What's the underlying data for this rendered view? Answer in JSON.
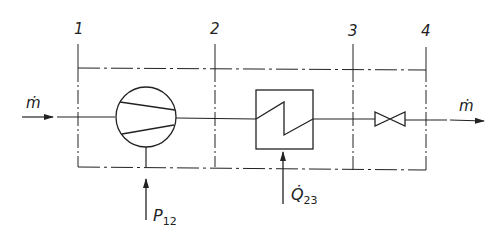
{
  "diagram": {
    "title": "",
    "state_points": [
      {
        "id": "1",
        "label": "1"
      },
      {
        "id": "2",
        "label": "2"
      },
      {
        "id": "3",
        "label": "3"
      },
      {
        "id": "4",
        "label": "4"
      }
    ],
    "flow_in": {
      "label": "ṁ"
    },
    "flow_out": {
      "label": "ṁ"
    },
    "components": [
      {
        "id": "compressor",
        "type": "compressor",
        "between": [
          "1",
          "2"
        ]
      },
      {
        "id": "heat-exchanger",
        "type": "heat-exchanger",
        "between": [
          "2",
          "3"
        ]
      },
      {
        "id": "throttle-valve",
        "type": "valve",
        "between": [
          "3",
          "4"
        ]
      }
    ],
    "inputs": {
      "power": {
        "symbol": "P",
        "subscript": "12"
      },
      "heat": {
        "symbol": "Q̇",
        "subscript": "23"
      }
    },
    "colors": {
      "line": "#222222",
      "background": "#ffffff"
    }
  }
}
